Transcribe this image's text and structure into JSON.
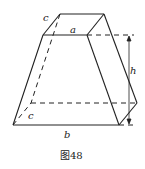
{
  "figure": {
    "caption": "图48",
    "labels": {
      "top_edge": "a",
      "bottom_edge": "b",
      "top_depth": "c",
      "bottom_depth": "c",
      "height": "h"
    },
    "colors": {
      "stroke": "#222222",
      "background": "#ffffff"
    }
  }
}
